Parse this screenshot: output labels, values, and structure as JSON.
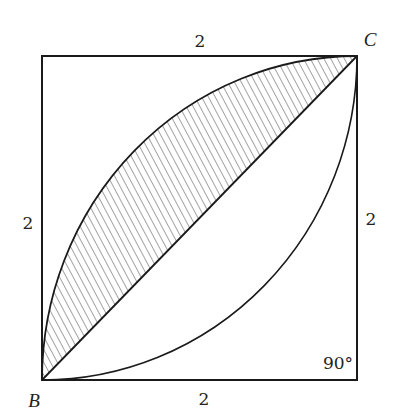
{
  "figure": {
    "type": "geometry",
    "vertices": {
      "B": {
        "label": "B",
        "position": "bottom-left"
      },
      "C": {
        "label": "C",
        "position": "top-right"
      }
    },
    "side_labels": {
      "top": "2",
      "bottom": "2",
      "left": "2",
      "right": "2"
    },
    "angle_label": "90°",
    "angle_corner": "bottom-right",
    "arcs": [
      {
        "center": "top-left",
        "radius": "2",
        "from": "B",
        "to": "C"
      },
      {
        "center": "bottom-right",
        "radius": "2",
        "from": "B",
        "to": "C"
      }
    ],
    "diagonal": {
      "from": "B",
      "to": "C"
    },
    "shaded_region": "between upper-left arc and diagonal BC",
    "colors": {
      "stroke": "#1a1a1a",
      "background": "#ffffff"
    }
  }
}
